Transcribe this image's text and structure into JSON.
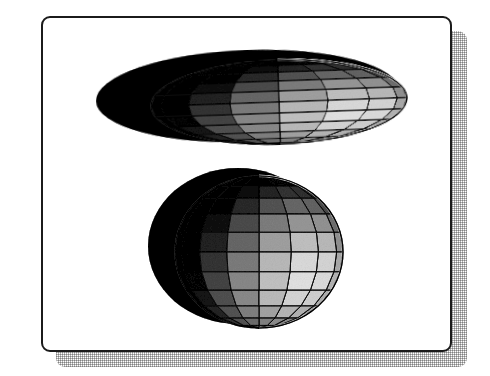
{
  "figure": {
    "title": "",
    "background_color": "#ffffff",
    "frame": {
      "border_color": "#1b1b1b",
      "border_width_px": 2,
      "corner_radius_px": 9,
      "fill_color": "#ffffff",
      "x": 41,
      "y": 16,
      "width": 411,
      "height": 336
    },
    "drop_shadow": {
      "color": "#787878",
      "pattern": "checkerboard-dither",
      "offset_x_px": 15,
      "offset_y_px": 15
    }
  },
  "chart_data": {
    "type": "scatter",
    "title": "",
    "subtitle": "",
    "xlabel": "",
    "ylabel": "",
    "grid": true,
    "legend": null,
    "render_style": "wireframe-shaded-surface",
    "shading": "lambertian-grayscale-dither",
    "light_direction": [
      0.62,
      -0.35,
      0.7
    ],
    "palette": {
      "surface_light": "#f2f2f2",
      "surface_mid": "#8c8c8c",
      "surface_dark": "#2a2a2a",
      "surface_shadow": "#111111",
      "wire_color": "#101010",
      "highlight": "#ffffff"
    },
    "mesh": {
      "meridians": 16,
      "parallels": 12,
      "wire_width_px": 0.8
    },
    "objects": [
      {
        "name": "oblate-ellipsoid-rear",
        "group": "top-pair",
        "role": "occluded-back-body",
        "shaded": false,
        "fill": "#141414",
        "center": [
          205,
          78
        ],
        "semi_axis_x": 152,
        "semi_axis_y": 46,
        "rotation_deg": -2,
        "wireframe": false
      },
      {
        "name": "oblate-ellipsoid-front",
        "group": "top-pair",
        "role": "shaded-front-body",
        "shaded": true,
        "center": [
          236,
          84
        ],
        "semi_axis_x": 128,
        "semi_axis_y": 42,
        "rotation_deg": -2,
        "wireframe": true
      },
      {
        "name": "prolate-ellipsoid-rear",
        "group": "bottom-pair",
        "role": "occluded-back-body",
        "shaded": false,
        "fill": "#141414",
        "center": [
          195,
          228
        ],
        "semi_axis_x": 90,
        "semi_axis_y": 78,
        "rotation_deg": 0,
        "wireframe": false
      },
      {
        "name": "prolate-ellipsoid-front",
        "group": "bottom-pair",
        "role": "shaded-front-body",
        "shaded": true,
        "center": [
          216,
          234
        ],
        "semi_axis_x": 84,
        "semi_axis_y": 76,
        "rotation_deg": 0,
        "wireframe": true
      }
    ]
  }
}
